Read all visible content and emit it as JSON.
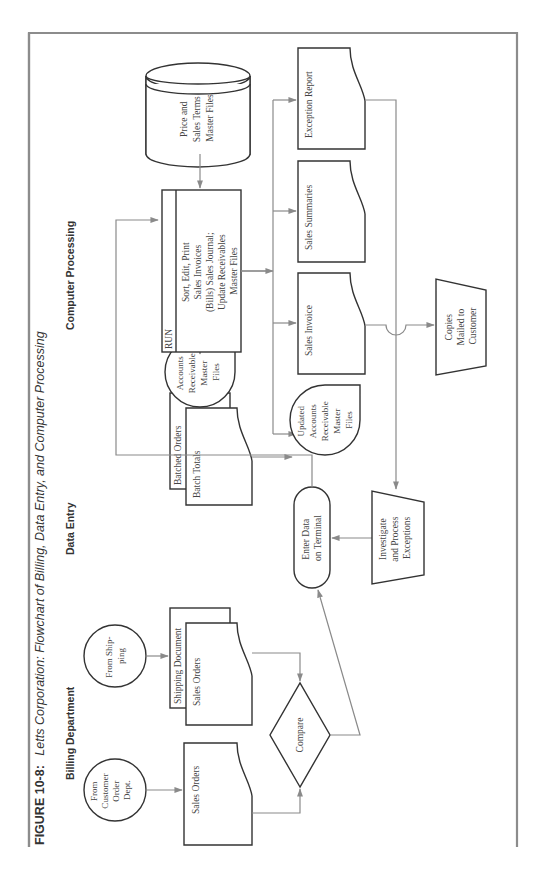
{
  "figure": {
    "label": "FIGURE 10-8:",
    "title": "Letts Corporation: Flowchart of Billing, Data Entry, and Computer Processing"
  },
  "columns": {
    "billing": "Billing Department",
    "data_entry": "Data Entry",
    "computer": "Computer Processing"
  },
  "nodes": {
    "from_customer": [
      "From",
      "Customer",
      "Order",
      "Dept."
    ],
    "sales_orders_1": "Sales Orders",
    "compare": "Compare",
    "from_shipping": [
      "From Ship-",
      "ping"
    ],
    "shipping_document": "Shipping Document",
    "sales_orders_2": "Sales Orders",
    "batched_orders": "Batched Orders",
    "batch_totals": "Batch Totals",
    "enter_data": [
      "Enter Data",
      "on Terminal"
    ],
    "investigate": [
      "Investigate",
      "and Process",
      "Exceptions"
    ],
    "ar_master": [
      "Accounts",
      "Receivable",
      "Master",
      "Files"
    ],
    "run_label": "RUN",
    "run_process": [
      "Sort, Edit, Print",
      "Sales Invoices",
      "(Bills) Sales Journal;",
      "Update Receivables",
      "Master Files"
    ],
    "price_master": [
      "Price and",
      "Sales Terms",
      "Master Files"
    ],
    "updated_ar": [
      "Updated",
      "Accounts",
      "Receivable",
      "Master",
      "Files"
    ],
    "sales_invoice": "Sales Invoice",
    "sales_summaries": "Sales Summaries",
    "exception_report": "Exception Report",
    "copies_mailed": [
      "Copies",
      "Mailed to",
      "Customer"
    ]
  },
  "colors": {
    "frame": "#8c8c8c",
    "flow_line": "#8a8a8a",
    "shape_stroke": "#333333"
  }
}
